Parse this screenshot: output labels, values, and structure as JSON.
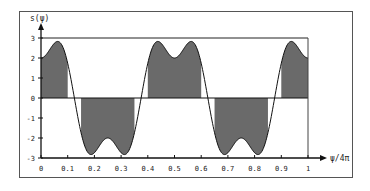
{
  "chart_data": {
    "type": "line",
    "title": "",
    "ylabel": "s(ψ)",
    "xlabel": "ψ/4π",
    "xlim": [
      0,
      1
    ],
    "ylim": [
      -3,
      3
    ],
    "xticks": [
      0,
      0.1,
      0.2,
      0.3,
      0.4,
      0.5,
      0.6,
      0.7,
      0.8,
      0.9,
      1
    ],
    "xtick_labels": [
      "0",
      "0.1",
      "0.2",
      "0.3",
      "0.4",
      "0.5",
      "0.6",
      "0.7",
      "0.8",
      "0.9",
      "1"
    ],
    "yticks": [
      -3,
      -2,
      -1,
      0,
      1,
      2,
      3
    ],
    "ytick_labels": [
      "-3",
      "-2",
      "-1",
      "0",
      "1",
      "2",
      "3"
    ],
    "grid": false,
    "reference_line_y": 3,
    "curve": {
      "description": "s = 3cos(4πx) - cos(12πx)",
      "coefficients": {
        "cos_4pi": 3,
        "cos_12pi": -1
      },
      "samples_x": [
        0,
        0.06,
        0.125,
        0.19,
        0.25,
        0.31,
        0.375,
        0.44,
        0.5,
        0.56,
        0.625,
        0.69,
        0.75,
        0.81,
        0.875,
        0.94,
        1
      ],
      "samples_y": [
        2,
        2.83,
        0,
        -2.83,
        -2,
        -2.83,
        0,
        2.83,
        2,
        2.83,
        0,
        -2.83,
        -2,
        -2.83,
        0,
        2.83,
        2
      ]
    },
    "shaded_intervals": [
      {
        "x": [
          0,
          0.1
        ],
        "sign": "positive"
      },
      {
        "x": [
          0.15,
          0.35
        ],
        "sign": "negative"
      },
      {
        "x": [
          0.4,
          0.6
        ],
        "sign": "positive"
      },
      {
        "x": [
          0.65,
          0.85
        ],
        "sign": "negative"
      },
      {
        "x": [
          0.9,
          1.0
        ],
        "sign": "positive"
      }
    ],
    "colors": {
      "fill": "#6a6a6a",
      "line": "#111111",
      "axis": "#111111"
    }
  }
}
